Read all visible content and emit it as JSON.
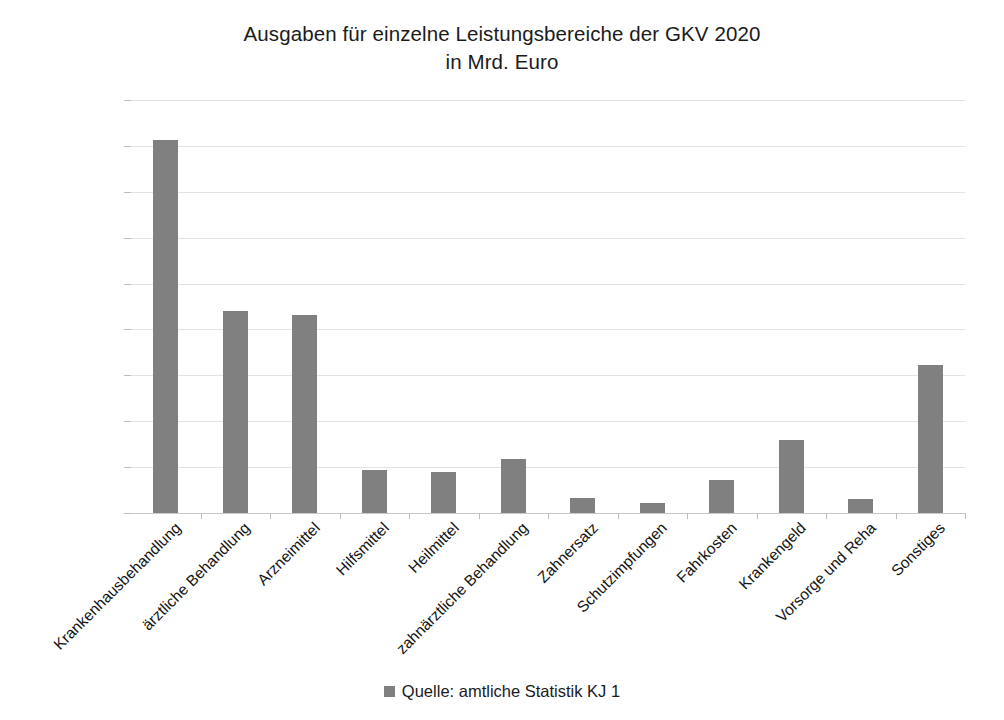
{
  "chart_data": {
    "type": "bar",
    "title": "Ausgaben für einzelne Leistungsbereiche der GKV 2020 in Mrd. Euro",
    "title_lines": [
      "Ausgaben für einzelne Leistungsbereiche der GKV 2020",
      "in Mrd. Euro"
    ],
    "xlabel": "",
    "ylabel": "",
    "ylim": [
      0,
      90
    ],
    "ytick_step": 10,
    "yticks": [
      "90",
      "80",
      "70",
      "60",
      "50",
      "40",
      "30",
      "20",
      "10",
      "0"
    ],
    "ytick_values": [
      90,
      80,
      70,
      60,
      50,
      40,
      30,
      20,
      10,
      0
    ],
    "grid": true,
    "grid_axis": "y",
    "legend_position": "bottom",
    "legend": [
      "Quelle: amtliche Statistik KJ 1"
    ],
    "series_color": "#808080",
    "categories": [
      "Krankenhausbehandlung",
      "ärztliche Behandlung",
      "Arzneimittel",
      "Hilfsmittel",
      "Heilmittel",
      "zahnärztliche Behandlung",
      "Zahnersatz",
      "Schutzimpfungen",
      "Fahrkosten",
      "Krankengeld",
      "Vorsorge und Reha",
      "Sonstiges"
    ],
    "values": [
      81.3,
      44.0,
      43.2,
      9.3,
      8.9,
      11.7,
      3.3,
      2.1,
      7.1,
      16.0,
      3.1,
      32.2
    ],
    "series": [
      {
        "name": "Quelle: amtliche Statistik KJ 1",
        "values": [
          81.3,
          44.0,
          43.2,
          9.3,
          8.9,
          11.7,
          3.3,
          2.1,
          7.1,
          16.0,
          3.1,
          32.2
        ]
      }
    ]
  },
  "legend": {
    "swatch_color": "#808080",
    "label": "Quelle: amtliche Statistik KJ 1"
  },
  "colors": {
    "bar": "#808080",
    "grid": "#e3e3e3",
    "axis": "#c9c9c9",
    "text": "#1b1b1b",
    "background": "#ffffff"
  }
}
